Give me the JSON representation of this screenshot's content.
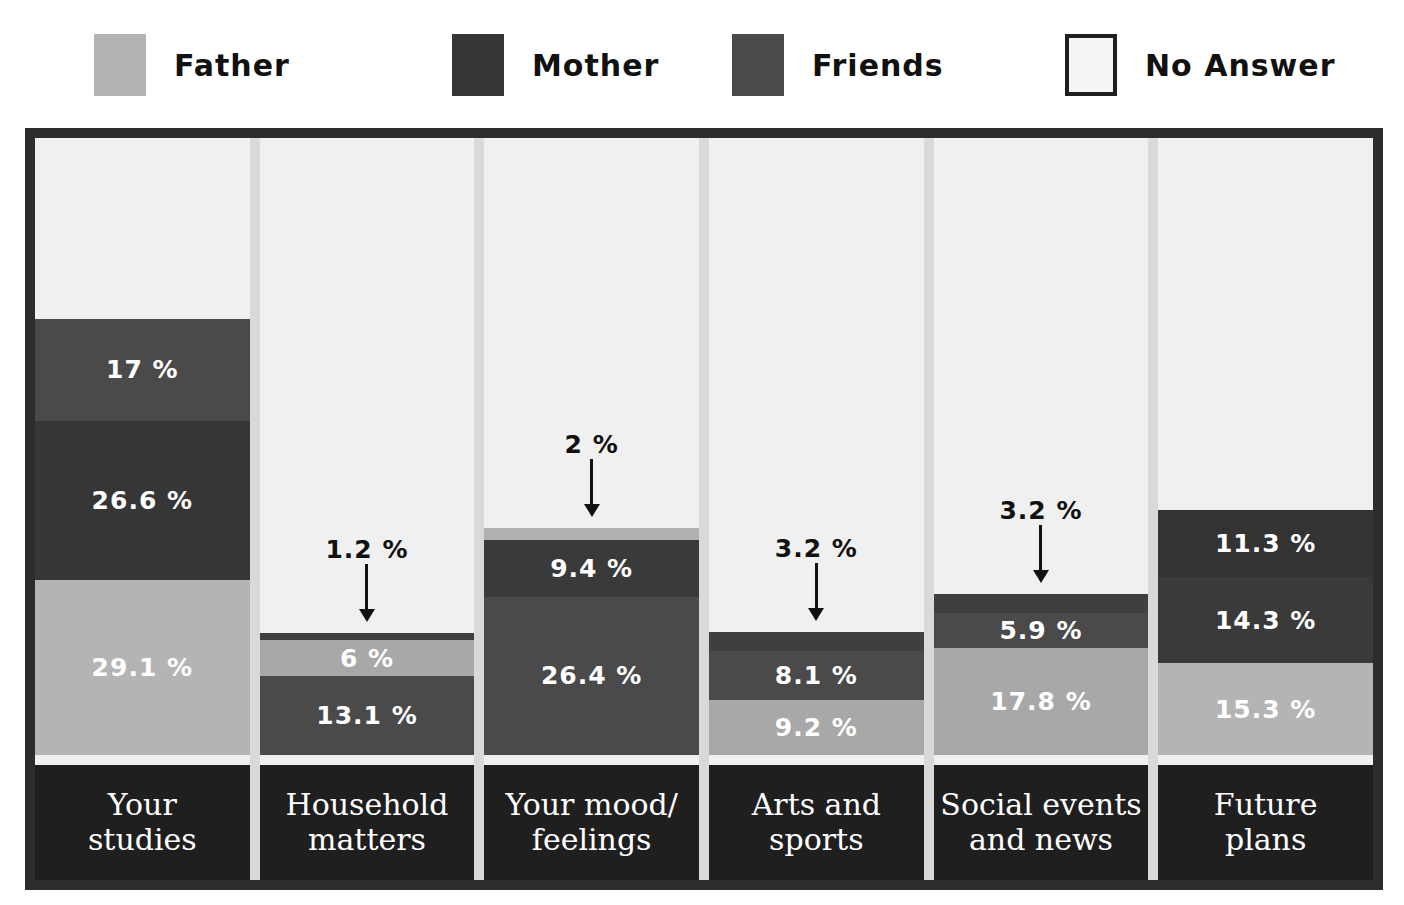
{
  "legend": {
    "items": [
      {
        "label": "Father",
        "color": "#b4b4b4",
        "icon": "legend-swatch-father",
        "bordered": false
      },
      {
        "label": "Mother",
        "color": "#363636",
        "icon": "legend-swatch-mother",
        "bordered": false
      },
      {
        "label": "Friends",
        "color": "#4a4a4a",
        "icon": "legend-swatch-friends",
        "bordered": false
      },
      {
        "label": "No Answer",
        "color": "#f5f5f5",
        "icon": "legend-swatch-no-answer",
        "bordered": true
      }
    ]
  },
  "chart_data": {
    "type": "bar",
    "subtype": "stacked-bar",
    "title": "",
    "xlabel": "",
    "ylabel": "",
    "ylim": [
      0,
      100
    ],
    "grid": false,
    "legend_position": "top",
    "value_suffix": "%",
    "categories": [
      "Your studies",
      "Household matters",
      "Your mood/ feelings",
      "Arts and sports",
      "Social events and news",
      "Future plans"
    ],
    "series": [
      {
        "name": "Father",
        "color": "#b4b4b4",
        "values": [
          29.1,
          6.0,
          2.0,
          9.2,
          17.8,
          15.3
        ]
      },
      {
        "name": "Mother",
        "color": "#363636",
        "values": [
          26.6,
          13.1,
          26.4,
          8.1,
          5.9,
          14.3
        ]
      },
      {
        "name": "Friends",
        "color": "#4a4a4a",
        "values": [
          17.0,
          1.2,
          9.4,
          3.2,
          3.2,
          11.3
        ]
      },
      {
        "name": "No Answer",
        "color": "#f0f0f0",
        "values": [
          27.3,
          79.7,
          62.2,
          79.5,
          73.1,
          59.1
        ]
      }
    ],
    "bars": [
      {
        "category_lines": [
          "Your",
          "studies"
        ],
        "segments": [
          {
            "series": "Father",
            "value": 29.1,
            "label": "29.1 %",
            "color": "#b4b4b4",
            "label_inside": true
          },
          {
            "series": "Mother",
            "value": 26.6,
            "label": "26.6 %",
            "color": "#363636",
            "label_inside": true
          },
          {
            "series": "Friends",
            "value": 17.0,
            "label": "17 %",
            "color": "#4a4a4a",
            "label_inside": true
          }
        ]
      },
      {
        "category_lines": [
          "Household",
          "matters"
        ],
        "segments": [
          {
            "series": "Mother",
            "value": 13.1,
            "label": "13.1 %",
            "color": "#4a4a4a",
            "label_inside": true
          },
          {
            "series": "Father",
            "value": 6.0,
            "label": "6 %",
            "color": "#a8a8a8",
            "label_inside": true
          },
          {
            "series": "Friends",
            "value": 1.2,
            "label": "1.2 %",
            "color": "#3f3f3f",
            "label_inside": false
          }
        ]
      },
      {
        "category_lines": [
          "Your mood/",
          "feelings"
        ],
        "segments": [
          {
            "series": "Mother",
            "value": 26.4,
            "label": "26.4 %",
            "color": "#4a4a4a",
            "label_inside": true
          },
          {
            "series": "Friends",
            "value": 9.4,
            "label": "9.4 %",
            "color": "#3a3a3a",
            "label_inside": true
          },
          {
            "series": "Father",
            "value": 2.0,
            "label": "2 %",
            "color": "#b0b0b0",
            "label_inside": false
          }
        ]
      },
      {
        "category_lines": [
          "Arts and",
          "sports"
        ],
        "segments": [
          {
            "series": "Father",
            "value": 9.2,
            "label": "9.2 %",
            "color": "#a8a8a8",
            "label_inside": true
          },
          {
            "series": "Mother",
            "value": 8.1,
            "label": "8.1 %",
            "color": "#4a4a4a",
            "label_inside": true
          },
          {
            "series": "Friends",
            "value": 3.2,
            "label": "3.2 %",
            "color": "#3f3f3f",
            "label_inside": false
          }
        ]
      },
      {
        "category_lines": [
          "Social events",
          "and news"
        ],
        "segments": [
          {
            "series": "Father",
            "value": 17.8,
            "label": "17.8 %",
            "color": "#a8a8a8",
            "label_inside": true
          },
          {
            "series": "Mother",
            "value": 5.9,
            "label": "5.9 %",
            "color": "#4a4a4a",
            "label_inside": true
          },
          {
            "series": "Friends",
            "value": 3.2,
            "label": "3.2 %",
            "color": "#3f3f3f",
            "label_inside": false
          }
        ]
      },
      {
        "category_lines": [
          "Future",
          "plans"
        ],
        "segments": [
          {
            "series": "Father",
            "value": 15.3,
            "label": "15.3 %",
            "color": "#b4b4b4",
            "label_inside": true
          },
          {
            "series": "Mother",
            "value": 14.3,
            "label": "14.3 %",
            "color": "#3a3a3a",
            "label_inside": true
          },
          {
            "series": "Friends",
            "value": 11.3,
            "label": "11.3 %",
            "color": "#333333",
            "label_inside": true
          }
        ]
      }
    ],
    "callouts": [
      {
        "bar": 1,
        "label": "1.2 %"
      },
      {
        "bar": 2,
        "label": "2 %"
      },
      {
        "bar": 3,
        "label": "3.2 %"
      },
      {
        "bar": 4,
        "label": "3.2 %"
      }
    ]
  },
  "colors": {
    "frame_border": "#2d2d2d",
    "plot_background": "#ededed",
    "category_band": "#1f1f1f",
    "column_gap": "#d9d9d9",
    "no_answer": "#f0f0f0",
    "label_text": "#ffffff",
    "callout_text": "#111111"
  }
}
